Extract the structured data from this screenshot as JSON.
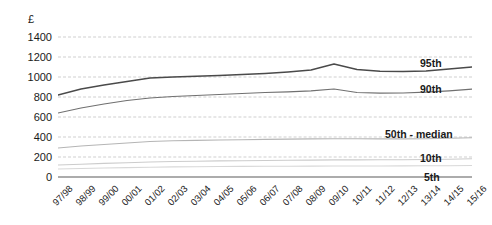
{
  "chart_data": {
    "type": "line",
    "title": "",
    "subtitle": "",
    "xlabel": "",
    "ylabel": "£",
    "ylim": [
      0,
      1400
    ],
    "ytick_values": [
      1400,
      1200,
      1000,
      800,
      600,
      400,
      200,
      0
    ],
    "ytick_labels": [
      "1400",
      "1200",
      "1000",
      "800",
      "600",
      "400",
      "200",
      "0"
    ],
    "grid": true,
    "grid_style": "dashed horizontal",
    "legend_position": "inline-right",
    "categories": [
      "97/98",
      "98/99",
      "99/00",
      "00/01",
      "01/02",
      "02/03",
      "03/04",
      "04/05",
      "05/06",
      "06/07",
      "07/08",
      "08/09",
      "09/10",
      "10/11",
      "11/12",
      "12/13",
      "13/14",
      "14/15",
      "15/16"
    ],
    "series": [
      {
        "name": "95th",
        "label": "95th",
        "color": "#4a4a4a",
        "width": 1.4,
        "values": [
          820,
          880,
          920,
          955,
          990,
          1000,
          1008,
          1015,
          1025,
          1035,
          1050,
          1070,
          1130,
          1075,
          1058,
          1055,
          1060,
          1080,
          1100
        ]
      },
      {
        "name": "90th",
        "label": "90th",
        "color": "#707070",
        "width": 1.2,
        "values": [
          640,
          690,
          730,
          765,
          790,
          805,
          815,
          825,
          835,
          845,
          852,
          862,
          880,
          845,
          838,
          840,
          848,
          862,
          878
        ]
      },
      {
        "name": "50th - median",
        "label": "50th - median",
        "color": "#b5b5b5",
        "width": 1.1,
        "values": [
          290,
          310,
          325,
          340,
          355,
          362,
          366,
          370,
          373,
          376,
          379,
          381,
          383,
          382,
          381,
          381,
          383,
          387,
          392
        ]
      },
      {
        "name": "10th",
        "label": "10th",
        "color": "#cccccc",
        "width": 1.1,
        "values": [
          120,
          128,
          136,
          143,
          150,
          155,
          158,
          161,
          163,
          165,
          167,
          169,
          171,
          171,
          172,
          173,
          175,
          178,
          182
        ]
      },
      {
        "name": "5th",
        "label": "5th",
        "color": "#d8d8d8",
        "width": 1.1,
        "values": [
          80,
          85,
          90,
          94,
          98,
          101,
          103,
          105,
          106,
          107,
          108,
          109,
          110,
          110,
          110,
          111,
          112,
          113,
          115
        ]
      }
    ],
    "series_labels_inline": [
      {
        "text": "95th",
        "left": 420,
        "top": 57
      },
      {
        "text": "90th",
        "left": 420,
        "top": 83
      },
      {
        "text": "50th - median",
        "left": 385,
        "top": 128
      },
      {
        "text": "10th",
        "left": 420,
        "top": 152
      },
      {
        "text": "5th",
        "left": 424,
        "top": 171
      }
    ]
  },
  "colors": {
    "background": "#ffffff",
    "grid": "#cfcfcf",
    "axis": "#5a5a5a",
    "text": "#1a1a1a"
  }
}
